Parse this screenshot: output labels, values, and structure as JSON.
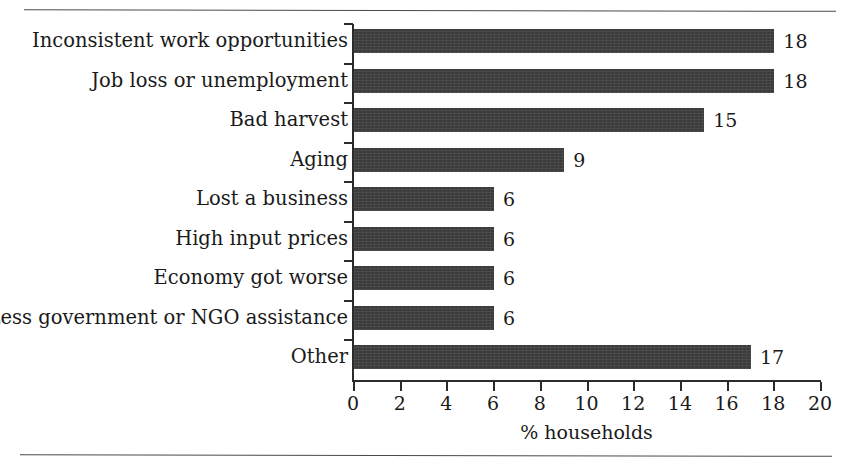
{
  "chart_data": {
    "type": "bar",
    "orientation": "horizontal",
    "title": "",
    "subtitle": "",
    "xlabel": "% households",
    "ylabel": "",
    "categories": [
      "Inconsistent work opportunities",
      "Job loss or unemployment",
      "Bad harvest",
      "Aging",
      "Lost a business",
      "High input prices",
      "Economy got worse",
      "Less government or NGO assistance",
      "Other"
    ],
    "values": [
      18,
      18,
      15,
      9,
      6,
      6,
      6,
      6,
      17
    ],
    "value_labels": [
      "18",
      "18",
      "15",
      "9",
      "6",
      "6",
      "6",
      "6",
      "17"
    ],
    "xlim": [
      0,
      20
    ],
    "xticks": [
      0,
      2,
      4,
      6,
      8,
      10,
      12,
      14,
      16,
      18,
      20
    ],
    "xtick_labels": [
      "0",
      "2",
      "4",
      "6",
      "8",
      "10",
      "12",
      "14",
      "16",
      "18",
      "20"
    ],
    "grid": false,
    "legend": null,
    "bar_color": "#3b3b3b",
    "axis_color": "#2b2b2b",
    "text_color": "#1a1a1a",
    "background": "#ffffff"
  },
  "figure": {
    "top_rule": "",
    "bottom_rule": ""
  }
}
